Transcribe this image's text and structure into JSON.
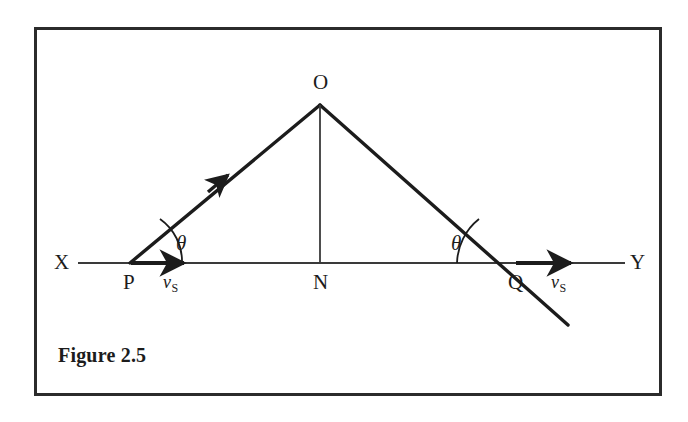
{
  "figure": {
    "caption": "Figure 2.5",
    "background_color": "#ffffff",
    "frame_color": "#2b2b2b",
    "ink_color": "#1c1c1c"
  },
  "labels": {
    "axis_left": "X",
    "axis_right": "Y",
    "point_source_start": "P",
    "point_foot": "N",
    "point_source_end": "Q",
    "point_apex": "O",
    "angle_left": "θ",
    "angle_right": "θ",
    "velocity_left_symbol": "v",
    "velocity_left_subscript": "S",
    "velocity_right_symbol": "v",
    "velocity_right_subscript": "S"
  },
  "geometry": {
    "axis_y": 263,
    "axis_x_start": 78,
    "axis_x_end": 625,
    "point_P": [
      130,
      263
    ],
    "point_N": [
      320,
      263
    ],
    "point_Q": [
      515,
      263
    ],
    "point_O": [
      320,
      105
    ],
    "oq_extension_end": [
      568,
      325
    ],
    "po_arrow_mid": [
      222,
      180
    ],
    "velocity_arrow_left": [
      130,
      185
    ],
    "velocity_arrow_right": [
      515,
      572
    ],
    "angle_arc_radius_left": 52,
    "angle_arc_radius_right": 58
  }
}
